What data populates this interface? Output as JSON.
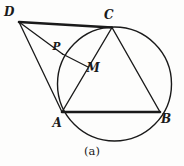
{
  "figure": {
    "caption": "(a)",
    "background_color": "#fdfdfc",
    "stroke_color": "#1a1a1a",
    "width": 184,
    "height": 166
  },
  "labels": {
    "D": "D",
    "C": "C",
    "P": "P",
    "M": "M",
    "A": "A",
    "B": "B"
  },
  "chart_data": {
    "type": "diagram",
    "title": "(a)",
    "coordinate_system": {
      "origin": "top-left",
      "xlim": [
        0,
        184
      ],
      "ylim": [
        0,
        166
      ],
      "units": "pixels"
    },
    "circle": {
      "name": "circumcircle",
      "cx": 114.5,
      "cy": 84.0,
      "r": 57.0,
      "stroke": "#1a1a1a",
      "stroke_width": 1.4,
      "fill": "none"
    },
    "points": [
      {
        "id": "D",
        "label": "D",
        "x": 19.0,
        "y": 22.0,
        "on_circle": false,
        "label_dx": -10.0,
        "label_dy": -10.0
      },
      {
        "id": "C",
        "label": "C",
        "x": 112.0,
        "y": 27.5,
        "on_circle": true,
        "label_dx": -3.0,
        "label_dy": -13.0
      },
      {
        "id": "P",
        "label": "P",
        "x": 62.5,
        "y": 54.0,
        "on_circle": true,
        "label_dx": -6.0,
        "label_dy": -8.0
      },
      {
        "id": "M",
        "label": "M",
        "x": 88.0,
        "y": 67.0,
        "on_circle": false,
        "label_dx": 5.0,
        "label_dy": 1.0
      },
      {
        "id": "A",
        "label": "A",
        "x": 62.0,
        "y": 112.0,
        "on_circle": true,
        "label_dx": -5.0,
        "label_dy": 11.0
      },
      {
        "id": "B",
        "label": "B",
        "x": 160.0,
        "y": 112.0,
        "on_circle": true,
        "label_dx": 6.0,
        "label_dy": 7.0
      }
    ],
    "segments": [
      {
        "id": "DC",
        "from": "D",
        "to": "C",
        "x1": 19.0,
        "y1": 22.0,
        "x2": 112.0,
        "y2": 27.5,
        "stroke_width": 2.6
      },
      {
        "id": "DP",
        "from": "D",
        "to": "P",
        "x1": 19.0,
        "y1": 22.0,
        "x2": 62.5,
        "y2": 54.0,
        "stroke_width": 1.3
      },
      {
        "id": "DA",
        "from": "D",
        "to": "A",
        "x1": 19.0,
        "y1": 22.0,
        "x2": 62.0,
        "y2": 112.0,
        "stroke_width": 1.3
      },
      {
        "id": "PM",
        "from": "P",
        "to": "M",
        "x1": 62.5,
        "y1": 54.0,
        "x2": 88.0,
        "y2": 67.0,
        "stroke_width": 1.3
      },
      {
        "id": "CA",
        "from": "C",
        "to": "A",
        "x1": 112.0,
        "y1": 27.5,
        "x2": 62.0,
        "y2": 112.0,
        "stroke_width": 1.4
      },
      {
        "id": "CB",
        "from": "C",
        "to": "B",
        "x1": 112.0,
        "y1": 27.5,
        "x2": 160.0,
        "y2": 112.0,
        "stroke_width": 1.4
      },
      {
        "id": "AB",
        "from": "A",
        "to": "B",
        "x1": 62.0,
        "y1": 112.0,
        "x2": 160.0,
        "y2": 112.0,
        "stroke_width": 2.6
      }
    ]
  }
}
